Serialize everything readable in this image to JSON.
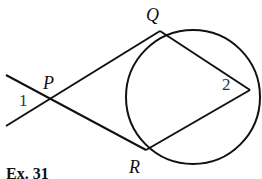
{
  "diagram": {
    "points": {
      "P": {
        "label": "P",
        "x": 49,
        "y": 99
      },
      "Q": {
        "label": "Q",
        "x": 160,
        "y": 31
      },
      "R": {
        "label": "R",
        "x": 146,
        "y": 150
      },
      "V": {
        "label": "",
        "x": 250,
        "y": 90
      }
    },
    "circle": {
      "cx": 193,
      "cy": 97,
      "r": 67
    },
    "angles": {
      "angle1": {
        "label": "1"
      },
      "angle2": {
        "label": "2"
      }
    },
    "caption": "Ex. 31",
    "stroke_color": "#111111"
  }
}
